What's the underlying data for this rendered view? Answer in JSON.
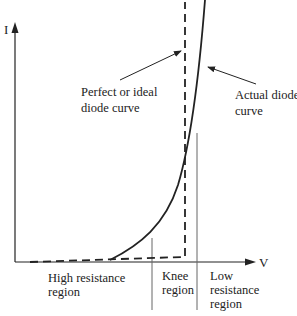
{
  "diagram": {
    "axes": {
      "y_label": "I",
      "x_label": "V"
    },
    "curves": [
      {
        "id": "ideal",
        "style": "dashed",
        "label_lines": [
          "Perfect or ideal",
          "diode curve"
        ]
      },
      {
        "id": "actual",
        "style": "solid",
        "label_lines": [
          "Actual diode",
          "curve"
        ]
      }
    ],
    "regions": [
      {
        "id": "high",
        "label_lines": [
          "High resistance",
          "region"
        ]
      },
      {
        "id": "knee",
        "label_lines": [
          "Knee",
          "region"
        ]
      },
      {
        "id": "low",
        "label_lines": [
          "Low",
          "resistance",
          "region"
        ]
      }
    ],
    "colors": {
      "ink": "#222222",
      "divider": "#666666",
      "background": "#ffffff"
    }
  }
}
